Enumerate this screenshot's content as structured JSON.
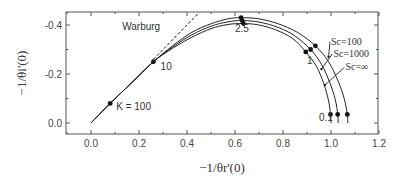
{
  "chart_data": {
    "type": "line",
    "title": "",
    "xlabel": "−1/θr'(0)",
    "ylabel": "−1/θi'(0)",
    "xlim": [
      -0.1,
      1.2
    ],
    "ylim": [
      0.05,
      -0.45
    ],
    "x_ticks": [
      0.0,
      0.2,
      0.4,
      0.6,
      0.8,
      1.0,
      1.2
    ],
    "x_tick_labels": [
      "0.0",
      "0.2",
      "0.4",
      "0.6",
      "0.8",
      "1.0",
      "1.2"
    ],
    "y_ticks": [
      0.0,
      -0.2,
      -0.4
    ],
    "y_tick_labels": [
      "0.0",
      "-0.2",
      "-0.4"
    ],
    "grid": false,
    "series": [
      {
        "name": "Sc=100",
        "x": [
          0.0,
          0.08,
          0.17,
          0.26,
          0.34,
          0.42,
          0.5,
          0.57,
          0.625,
          0.7,
          0.78,
          0.86,
          0.935,
          0.99,
          1.03,
          1.055,
          1.068,
          1.07
        ],
        "y": [
          0.0,
          -0.08,
          -0.165,
          -0.25,
          -0.315,
          -0.37,
          -0.405,
          -0.425,
          -0.43,
          -0.425,
          -0.405,
          -0.37,
          -0.315,
          -0.25,
          -0.17,
          -0.1,
          -0.035,
          0.0
        ]
      },
      {
        "name": "Sc=1000",
        "x": [
          0.0,
          0.08,
          0.17,
          0.26,
          0.34,
          0.42,
          0.5,
          0.57,
          0.63,
          0.7,
          0.78,
          0.85,
          0.915,
          0.96,
          0.995,
          1.018,
          1.028,
          1.03
        ],
        "y": [
          0.0,
          -0.08,
          -0.165,
          -0.25,
          -0.31,
          -0.36,
          -0.395,
          -0.413,
          -0.418,
          -0.412,
          -0.39,
          -0.355,
          -0.3,
          -0.24,
          -0.165,
          -0.095,
          -0.035,
          0.0
        ]
      },
      {
        "name": "Sc=∞",
        "x": [
          0.0,
          0.08,
          0.17,
          0.26,
          0.34,
          0.42,
          0.5,
          0.57,
          0.635,
          0.7,
          0.77,
          0.84,
          0.895,
          0.94,
          0.97,
          0.99,
          0.998,
          1.0
        ],
        "y": [
          0.0,
          -0.08,
          -0.165,
          -0.25,
          -0.305,
          -0.35,
          -0.385,
          -0.402,
          -0.406,
          -0.4,
          -0.38,
          -0.345,
          -0.29,
          -0.23,
          -0.16,
          -0.09,
          -0.035,
          0.0
        ]
      },
      {
        "name": "Warburg",
        "style": "dashed",
        "x": [
          0.26,
          0.45
        ],
        "y": [
          -0.26,
          -0.45
        ]
      }
    ],
    "markers": [
      {
        "label": "K = 100",
        "x": 0.08,
        "y": -0.08
      },
      {
        "label": "10",
        "x": 0.26,
        "y": -0.25
      },
      {
        "label": "2.5",
        "x": 0.625,
        "y": -0.43
      },
      {
        "label": "2.5",
        "x": 0.63,
        "y": -0.418
      },
      {
        "label": "2.5",
        "x": 0.635,
        "y": -0.406
      },
      {
        "label": "1",
        "x": 0.935,
        "y": -0.315
      },
      {
        "label": "1",
        "x": 0.915,
        "y": -0.3
      },
      {
        "label": "1",
        "x": 0.895,
        "y": -0.29
      },
      {
        "label": "0.1",
        "x": 1.068,
        "y": -0.035
      },
      {
        "label": "0.1",
        "x": 1.028,
        "y": -0.035
      },
      {
        "label": "0.1",
        "x": 0.998,
        "y": -0.035
      }
    ],
    "annotations": [
      {
        "text": "Warburg",
        "x": 0.13,
        "y": -0.38
      },
      {
        "text": "K = 100",
        "x": 0.105,
        "y": -0.055
      },
      {
        "text": "10",
        "x": 0.29,
        "y": -0.215
      },
      {
        "text": "2.5",
        "x": 0.6,
        "y": -0.37
      },
      {
        "text": "1",
        "x": 0.9,
        "y": -0.24
      },
      {
        "text": "0.1",
        "x": 0.95,
        "y": -0.01
      },
      {
        "text": "Sc=100",
        "x": 1.0,
        "y": -0.32
      },
      {
        "text": "Sc=1000",
        "x": 1.01,
        "y": -0.27
      },
      {
        "text": "Sc=∞",
        "x": 1.06,
        "y": -0.215
      }
    ],
    "sc_labels": [
      {
        "text": "Sc=100",
        "series": "Sc=100",
        "x": 0.99,
        "y": -0.27
      },
      {
        "text": "Sc=1000",
        "series": "Sc=1000",
        "x": 0.96,
        "y": -0.22
      },
      {
        "text": "Sc=∞",
        "series": "Sc=∞",
        "x": 0.975,
        "y": -0.155
      }
    ]
  }
}
